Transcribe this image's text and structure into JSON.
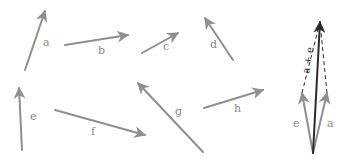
{
  "diagram": {
    "colors": {
      "vector": "#8f8f8f",
      "sum_vector": "#2b2b2b",
      "dashed": "#2b2b2b",
      "background": "#ffffff"
    },
    "vectors": [
      {
        "label": "a",
        "x1": 25,
        "y1": 70,
        "x2": 45,
        "y2": 11,
        "lx": 43,
        "ly": 46
      },
      {
        "label": "b",
        "x1": 65,
        "y1": 45,
        "x2": 128,
        "y2": 35,
        "lx": 98,
        "ly": 54
      },
      {
        "label": "c",
        "x1": 142,
        "y1": 53,
        "x2": 178,
        "y2": 33,
        "lx": 163,
        "ly": 50
      },
      {
        "label": "d",
        "x1": 233,
        "y1": 60,
        "x2": 205,
        "y2": 18,
        "lx": 210,
        "ly": 48
      },
      {
        "label": "e",
        "x1": 22,
        "y1": 150,
        "x2": 19,
        "y2": 88,
        "lx": 30,
        "ly": 120
      },
      {
        "label": "f",
        "x1": 55,
        "y1": 110,
        "x2": 145,
        "y2": 135,
        "lx": 91,
        "ly": 135
      },
      {
        "label": "g",
        "x1": 203,
        "y1": 152,
        "x2": 138,
        "y2": 83,
        "lx": 175,
        "ly": 115
      },
      {
        "label": "h",
        "x1": 204,
        "y1": 108,
        "x2": 263,
        "y2": 90,
        "lx": 234,
        "ly": 112
      }
    ],
    "sum_figure": {
      "tail": {
        "x": 313,
        "y": 153
      },
      "e": {
        "label": "e",
        "x2": 302,
        "y2": 93,
        "lx": 293,
        "ly": 127
      },
      "a": {
        "label": "a",
        "x2": 327,
        "y2": 93,
        "lx": 327,
        "ly": 127
      },
      "sum": {
        "label": "a + e",
        "x2": 320,
        "y2": 22,
        "lx": 309,
        "ly": 74
      }
    }
  }
}
